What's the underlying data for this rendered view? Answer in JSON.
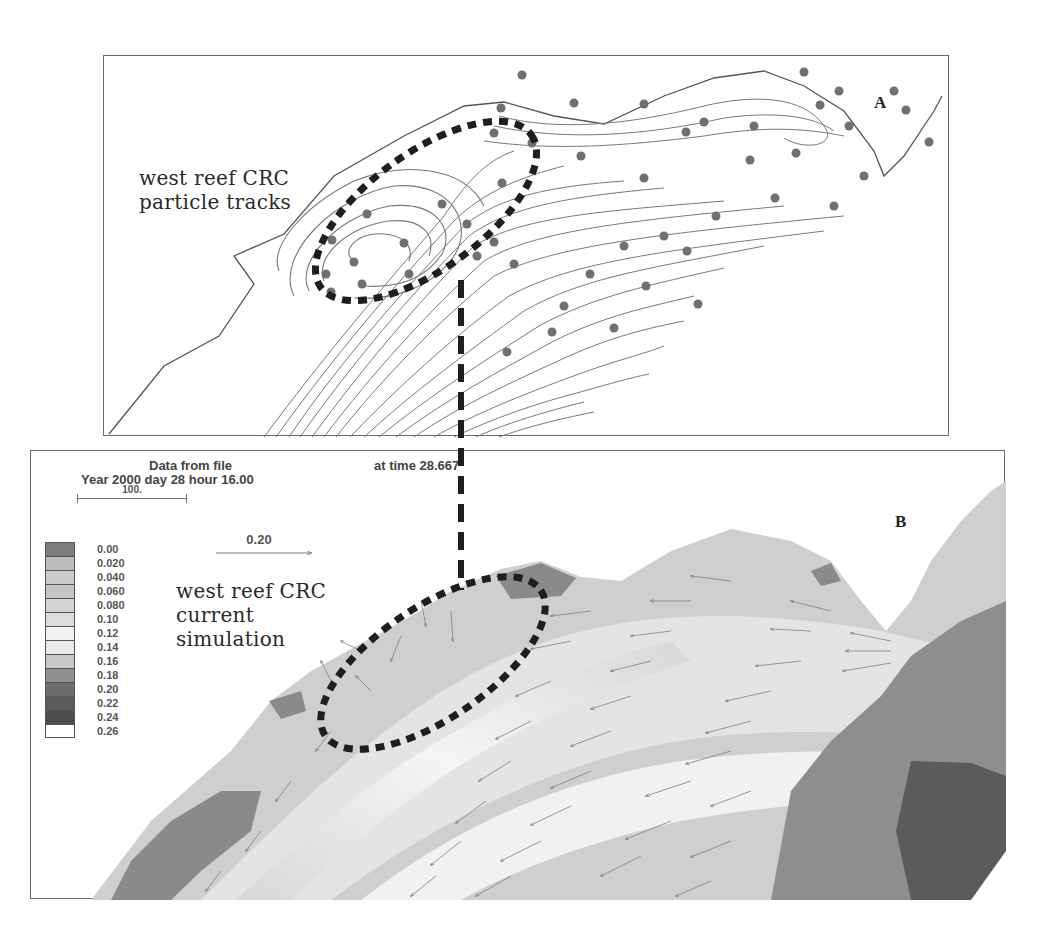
{
  "figure": {
    "panel_a": {
      "letter": "A",
      "annotation": [
        "west reef CRC",
        "particle tracks"
      ]
    },
    "panel_b": {
      "letter": "B",
      "header": {
        "line1": "Data from file",
        "line2": "Year 2000 day  28 hour 16.00",
        "time_label": "at time  28.667"
      },
      "scale_bar_label": "100.",
      "vector_reference_label": "0.20",
      "annotation": [
        "west reef CRC",
        "current",
        "simulation"
      ],
      "legend": [
        {
          "label": "0.00",
          "color": "#7d7d7d"
        },
        {
          "label": "0.020",
          "color": "#bdbdbd"
        },
        {
          "label": "0.040",
          "color": "#cbcbcb"
        },
        {
          "label": "0.060",
          "color": "#c6c6c6"
        },
        {
          "label": "0.080",
          "color": "#d4d4d4"
        },
        {
          "label": "0.10",
          "color": "#dcdcdc"
        },
        {
          "label": "0.12",
          "color": "#f2f2f2"
        },
        {
          "label": "0.14",
          "color": "#e9e9e9"
        },
        {
          "label": "0.16",
          "color": "#c8c8c8"
        },
        {
          "label": "0.18",
          "color": "#8f8f8f"
        },
        {
          "label": "0.20",
          "color": "#6d6d6d"
        },
        {
          "label": "0.22",
          "color": "#5a5a5a"
        },
        {
          "label": "0.24",
          "color": "#4e4e4e"
        },
        {
          "label": "0.26",
          "color": "#ffffff"
        }
      ]
    }
  }
}
